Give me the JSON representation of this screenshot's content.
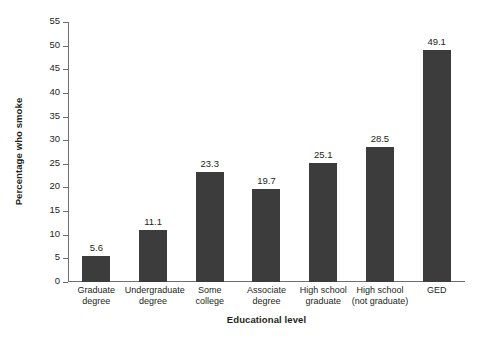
{
  "chart_data": {
    "type": "bar",
    "title": "",
    "xlabel": "Educational level",
    "ylabel": "Percentage who smoke",
    "categories": [
      "Graduate degree",
      "Undergraduate degree",
      "Some college",
      "Associate degree",
      "High school graduate",
      "High school (not graduate)",
      "GED"
    ],
    "category_lines": [
      [
        "Graduate",
        "degree"
      ],
      [
        "Undergraduate",
        "degree"
      ],
      [
        "Some",
        "college"
      ],
      [
        "Associate",
        "degree"
      ],
      [
        "High school",
        "graduate"
      ],
      [
        "High school",
        "(not graduate)"
      ],
      [
        "GED",
        ""
      ]
    ],
    "values": [
      5.6,
      11.1,
      23.3,
      19.7,
      25.1,
      28.5,
      49.1
    ],
    "value_labels": [
      "5.6",
      "11.1",
      "23.3",
      "19.7",
      "25.1",
      "28.5",
      "49.1"
    ],
    "ylim": [
      0,
      55
    ],
    "ytick_step": 5,
    "yticks": [
      0,
      5,
      10,
      15,
      20,
      25,
      30,
      35,
      40,
      45,
      50,
      55
    ],
    "ytick_labels": [
      "0",
      "5",
      "10",
      "15",
      "20",
      "25",
      "30",
      "35",
      "40",
      "45",
      "50",
      "55"
    ],
    "grid": false,
    "legend": null,
    "bar_color": "#3c3c3c",
    "axis_color": "#6d6e71",
    "background": "#ffffff"
  }
}
